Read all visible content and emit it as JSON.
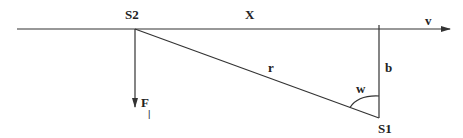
{
  "diagram": {
    "type": "geometry-vector-diagram",
    "labels": {
      "s2": "S2",
      "x": "X",
      "v": "v",
      "r": "r",
      "b": "b",
      "w": "w",
      "f": "F",
      "f_sub": "|",
      "s1": "S1"
    },
    "colors": {
      "line": "#333333",
      "text": "#222222",
      "background": "#ffffff"
    },
    "elements": [
      {
        "id": "x-axis",
        "kind": "arrow",
        "from": [
          17,
          29
        ],
        "to": [
          452,
          29
        ],
        "label": "v"
      },
      {
        "id": "force-arrow",
        "kind": "arrow",
        "from": [
          135,
          29
        ],
        "to": [
          135,
          108
        ],
        "label": "F|"
      },
      {
        "id": "b-segment",
        "kind": "line",
        "from": [
          379,
          25
        ],
        "to": [
          379,
          118
        ],
        "label": "b"
      },
      {
        "id": "r-segment",
        "kind": "line",
        "from": [
          135,
          29
        ],
        "to": [
          379,
          118
        ],
        "label": "r"
      },
      {
        "id": "w-angle",
        "kind": "arc",
        "at": [
          379,
          118
        ],
        "label": "w"
      }
    ]
  }
}
